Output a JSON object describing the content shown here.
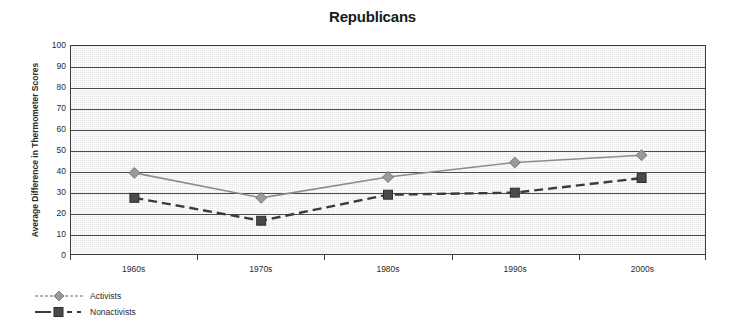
{
  "chart_data": {
    "type": "line",
    "title": "Republicans",
    "xlabel": "",
    "ylabel": "Average Difference in Thermometer Scores",
    "categories": [
      "1960s",
      "1970s",
      "1980s",
      "1990s",
      "2000s"
    ],
    "ylim": [
      0,
      100
    ],
    "ytick_step": 10,
    "yticks": [
      100,
      90,
      80,
      70,
      60,
      50,
      40,
      30,
      20,
      10,
      0
    ],
    "grid": true,
    "legend_position": "bottom-left",
    "series": [
      {
        "name": "Activists",
        "values": [
          39,
          27,
          37,
          44,
          47.5
        ],
        "marker": "diamond",
        "line_style": "solid",
        "color": "#8c8c8c"
      },
      {
        "name": "Nonactivists",
        "values": [
          27,
          16,
          28.5,
          29.5,
          36.5
        ],
        "marker": "square",
        "line_style": "dashed",
        "color": "#3a3a3a"
      }
    ]
  },
  "legend": {
    "items": [
      {
        "label": "Activists"
      },
      {
        "label": "Nonactivists"
      }
    ]
  },
  "colors": {
    "activists_line": "#8c8c8c",
    "nonactivists_line": "#3a3a3a",
    "gridline": "#4a4a4a",
    "plot_background": "#e8e8e8",
    "frame_border": "#3d3d3d",
    "text": "#2b2b2b"
  }
}
